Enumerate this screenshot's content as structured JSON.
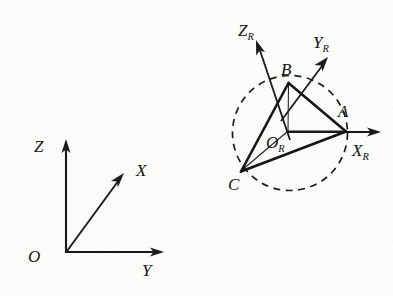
{
  "figure": {
    "background_color": "#fdfdfc",
    "ink_color": "#171513",
    "width": 393,
    "height": 296
  },
  "world_frame": {
    "name": "world-coordinate-frame",
    "origin_label": "O",
    "axes": [
      {
        "id": "z",
        "label": "Z",
        "direction": "up"
      },
      {
        "id": "x",
        "label": "X",
        "direction": "up-right-diagonal"
      },
      {
        "id": "y",
        "label": "Y",
        "direction": "right"
      }
    ]
  },
  "rotated_frame": {
    "name": "rotated-coordinate-frame",
    "origin_label": "O",
    "origin_subscript": "R",
    "axes": [
      {
        "id": "zr",
        "label": "Z",
        "subscript": "R",
        "direction": "up-left-diagonal"
      },
      {
        "id": "yr",
        "label": "Y",
        "subscript": "R",
        "direction": "up-right-diagonal"
      },
      {
        "id": "xr",
        "label": "X",
        "subscript": "R",
        "direction": "right"
      }
    ]
  },
  "triangle": {
    "name": "triangle-abc",
    "vertices": [
      {
        "id": "a",
        "label": "A"
      },
      {
        "id": "b",
        "label": "B"
      },
      {
        "id": "c",
        "label": "C"
      }
    ],
    "edges": [
      "A-B",
      "B-C",
      "C-A"
    ],
    "spokes": [
      "OR-A",
      "OR-B",
      "OR-C"
    ]
  },
  "circle": {
    "name": "dashed-circumcircle",
    "style": "dashed",
    "passes_through": [
      "A",
      "B",
      "C"
    ]
  }
}
